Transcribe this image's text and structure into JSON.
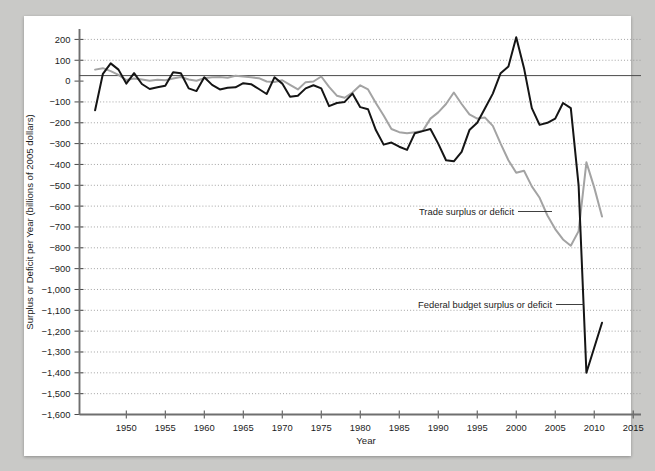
{
  "chart_data": {
    "type": "line",
    "title": "",
    "xlabel": "Year",
    "ylabel": "Surplus or Deficit per Year (billions of 2005 dollars)",
    "xlim": [
      1944,
      2016
    ],
    "ylim": [
      -1600,
      250
    ],
    "grid": true,
    "legend_position": "inline-annotations",
    "xticks": [
      1950,
      1955,
      1960,
      1965,
      1970,
      1975,
      1980,
      1985,
      1990,
      1995,
      2000,
      2005,
      2010,
      2015
    ],
    "xtick_labels": [
      "1950",
      "1955",
      "1960",
      "1965",
      "1970",
      "1975",
      "1980",
      "1985",
      "1990",
      "1995",
      "2000",
      "2005",
      "2010",
      "2015"
    ],
    "yticks": [
      200,
      100,
      0,
      -100,
      -200,
      -300,
      -400,
      -500,
      -600,
      -700,
      -800,
      -900,
      -1000,
      -1100,
      -1200,
      -1300,
      -1400,
      -1500,
      -1600
    ],
    "ytick_labels": [
      "200",
      "100",
      "0",
      "−100",
      "−200",
      "−300",
      "−400",
      "−500",
      "−600",
      "−700",
      "−800",
      "−900",
      "−1,000",
      "−1,100",
      "−1,200",
      "−1,300",
      "−1,400",
      "−1,500",
      "−1,600"
    ],
    "x": [
      1946,
      1947,
      1948,
      1949,
      1950,
      1951,
      1952,
      1953,
      1954,
      1955,
      1956,
      1957,
      1958,
      1959,
      1960,
      1961,
      1962,
      1963,
      1964,
      1965,
      1966,
      1967,
      1968,
      1969,
      1970,
      1971,
      1972,
      1973,
      1974,
      1975,
      1976,
      1977,
      1978,
      1979,
      1980,
      1981,
      1982,
      1983,
      1984,
      1985,
      1986,
      1987,
      1988,
      1989,
      1990,
      1991,
      1992,
      1993,
      1994,
      1995,
      1996,
      1997,
      1998,
      1999,
      2000,
      2001,
      2002,
      2003,
      2004,
      2005,
      2006,
      2007,
      2008,
      2009,
      2010,
      2011
    ],
    "series": [
      {
        "name": "Federal budget surplus or deficit",
        "color": "#151515",
        "values": [
          -140,
          35,
          85,
          55,
          -12,
          38,
          -14,
          -38,
          -30,
          -22,
          42,
          38,
          -35,
          -48,
          18,
          -18,
          -40,
          -32,
          -30,
          -10,
          -15,
          -38,
          -62,
          18,
          -12,
          -75,
          -70,
          -35,
          -20,
          -35,
          -120,
          -105,
          -100,
          -60,
          -125,
          -135,
          -235,
          -305,
          -295,
          -315,
          -330,
          -250,
          -240,
          -230,
          -300,
          -380,
          -385,
          -340,
          -235,
          -200,
          -130,
          -60,
          38,
          70,
          210,
          62,
          -130,
          -210,
          -200,
          -180,
          -105,
          -130,
          -500,
          -1400,
          -1280,
          -1160
        ]
      },
      {
        "name": "Trade surplus or deficit",
        "color": "#a3a3a3",
        "values": [
          55,
          62,
          48,
          30,
          5,
          12,
          8,
          2,
          6,
          4,
          12,
          20,
          8,
          2,
          14,
          18,
          20,
          16,
          26,
          22,
          18,
          14,
          -2,
          -4,
          4,
          -18,
          -40,
          -5,
          -2,
          22,
          -28,
          -70,
          -80,
          -55,
          -20,
          -40,
          -105,
          -165,
          -230,
          -245,
          -250,
          -245,
          -240,
          -180,
          -150,
          -110,
          -55,
          -110,
          -160,
          -180,
          -175,
          -215,
          -300,
          -380,
          -440,
          -430,
          -505,
          -560,
          -645,
          -710,
          -760,
          -790,
          -720,
          -390,
          -510,
          -650
        ]
      }
    ],
    "annotations": [
      {
        "text": "Trade surplus or deficit",
        "series": "Trade surplus or deficit"
      },
      {
        "text": "Federal budget surplus or deficit",
        "series": "Federal budget surplus or deficit"
      }
    ]
  },
  "figure": {
    "background": "#ffffff",
    "page_background": "#c9c9c7"
  }
}
